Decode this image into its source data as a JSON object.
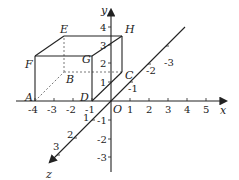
{
  "figure": {
    "axes": {
      "x": {
        "label": "x",
        "ticks": [
          "-4",
          "-3",
          "-2",
          "-1",
          "1",
          "2",
          "3",
          "4",
          "5"
        ]
      },
      "y": {
        "label": "y",
        "ticks": [
          "1",
          "2",
          "3",
          "4",
          "-1",
          "-2",
          "-3"
        ]
      },
      "z": {
        "label": "z",
        "ticks": [
          "1",
          "2",
          "3",
          "-1",
          "-2",
          "-3"
        ]
      },
      "origin": "O"
    },
    "points": {
      "A": "A",
      "B": "B",
      "C": "C",
      "D": "D",
      "E": "E",
      "F": "F",
      "G": "G",
      "H": "H"
    },
    "colors": {
      "line": "#222222",
      "dashed": "#555555"
    }
  }
}
